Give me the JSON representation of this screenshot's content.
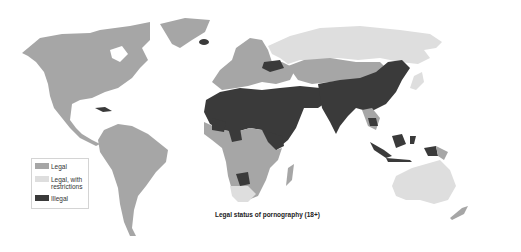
{
  "map": {
    "title": "Legal status of pornography (18+)",
    "colors": {
      "legal": "#a6a6a6",
      "legal_with_restrictions": "#dedede",
      "illegal": "#3a3a3a",
      "background": "#ffffff"
    },
    "legend": {
      "items": [
        {
          "key": "legal",
          "label": "Legal",
          "color": "#a6a6a6"
        },
        {
          "key": "legal_with_restrictions",
          "label": "Legal, with restrictions",
          "color": "#dedede"
        },
        {
          "key": "illegal",
          "label": "Illegal",
          "color": "#3a3a3a"
        }
      ]
    },
    "regions": {
      "legal": [
        "North America",
        "Greenland",
        "Central America",
        "South America",
        "Western Europe",
        "Central Asia",
        "Mongolia",
        "Southern & Central Africa",
        "Madagascar",
        "New Zealand",
        "Japan",
        "Taiwan",
        "Papua New Guinea"
      ],
      "legal_with_restrictions": [
        "Russia",
        "South Africa",
        "Australia",
        "Japan",
        "Kazakhstan"
      ],
      "illegal": [
        "Ukraine",
        "North Africa",
        "Middle East",
        "China",
        "India",
        "Iceland",
        "Cuba",
        "Nigeria",
        "Ethiopia",
        "Eritrea",
        "Botswana",
        "Indonesia",
        "Malaysia",
        "Cambodia",
        "North Korea",
        "Western Sahara region"
      ]
    }
  }
}
